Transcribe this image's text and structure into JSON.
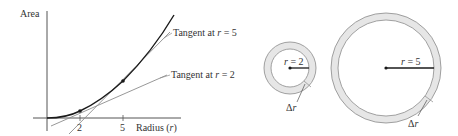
{
  "graph": {
    "y_axis_label": "Area",
    "x_axis_label": "Radius (",
    "x_axis_var": "r",
    "x_axis_close": ")",
    "ticks": [
      "2",
      "5"
    ],
    "tangent_5_label": "Tangent at ",
    "tangent_5_var": "r",
    "tangent_5_value": " = 5",
    "tangent_2_label": "Tangent at ",
    "tangent_2_var": "r",
    "tangent_2_value": " = 2"
  },
  "small_ring": {
    "radius_var": "r",
    "radius_value": " = 2",
    "delta_label": "Δ",
    "delta_var": "r"
  },
  "large_ring": {
    "radius_var": "r",
    "radius_value": " = 5",
    "delta_label": "Δ",
    "delta_var": "r"
  },
  "colors": {
    "curve": "#1a1a1a",
    "tangent": "#8c8c8c",
    "axis": "#555555",
    "ring_fill": "#e6e6e6",
    "ring_stroke": "#8a8a8a"
  }
}
